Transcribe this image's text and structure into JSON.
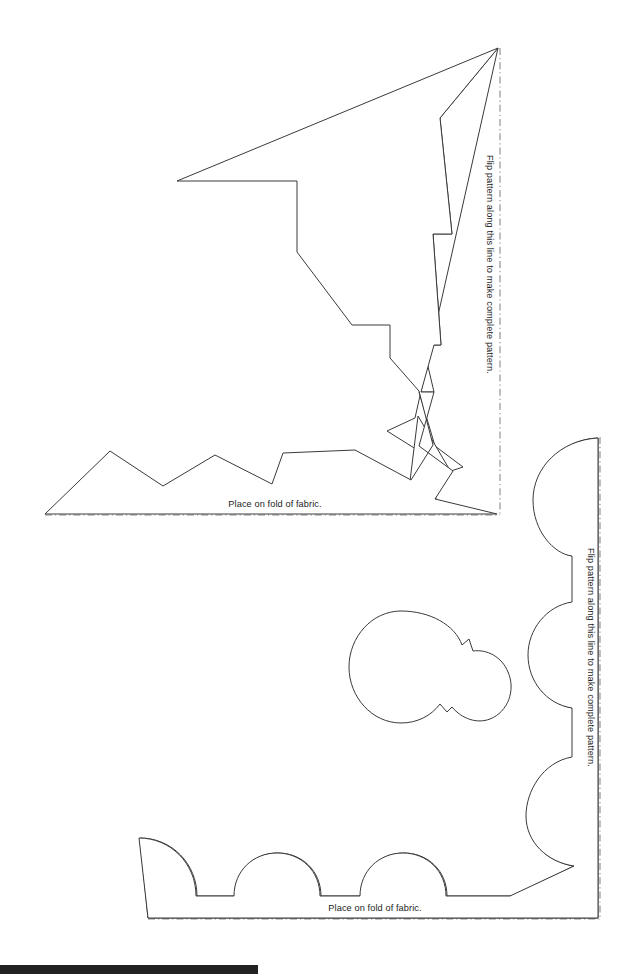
{
  "document": {
    "kind": "sewing-pattern-template-sheet",
    "background_color": "#ffffff",
    "outline_color": "#3a3a3a",
    "fold_line_color": "#8b8b8b",
    "text_color": "#1c1c1c",
    "width": 640,
    "height": 974
  },
  "patterns": [
    {
      "id": "zigzag-pattern",
      "name": "Pointed zigzag corner pattern",
      "fold_label_bottom": "Place on fold of fabric.",
      "fold_label_right": "Flip pattern along this line to make complete pattern.",
      "edge_style": "zigzag",
      "fold_lines": {
        "bottom": {
          "x1": 45,
          "y1": 515,
          "x2": 500,
          "y2": 515
        },
        "right": {
          "x1": 500,
          "y1": 48,
          "x2": 500,
          "y2": 515
        }
      },
      "bottom_label_pos": {
        "x": 275,
        "y": 507
      },
      "right_label_pos": {
        "x": 487,
        "y": 155
      },
      "shapes": [
        {
          "id": "zigzag-border-band",
          "name": "outer zigzag band",
          "points": "498,48 440,118 452,234 433,234 441,345 425,344 434,390 421,390 435,445 464,466 451,470 386,430 380,397 310,399 322,366 261,366 266,319 235,293 243,183 177,181 177,294 244,295 238,321 268,325 267,362 326,360 314,395 382,396 391,432 454,472 432,477 435,498 355,450 283,453 272,483 215,455 163,485 110,451 45,514 498,514"
        }
      ]
    },
    {
      "id": "scallop-pattern",
      "name": "Rounded scallop corner pattern",
      "fold_label_bottom": "Place on fold of fabric.",
      "fold_label_right": "Flip pattern along this line to make complete pattern.",
      "edge_style": "scallop",
      "fold_lines": {
        "bottom": {
          "x1": 148,
          "y1": 919,
          "x2": 600,
          "y2": 919
        },
        "right": {
          "x1": 600,
          "y1": 437,
          "x2": 600,
          "y2": 919
        }
      },
      "bottom_label_pos": {
        "x": 375,
        "y": 911
      },
      "right_label_pos": {
        "x": 588,
        "y": 548
      }
    }
  ],
  "scan_artifact": {
    "name": "scanner-edge-bar",
    "color": "#222222",
    "width": 258,
    "height": 9
  }
}
